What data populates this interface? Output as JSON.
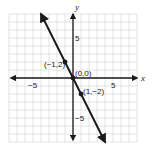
{
  "chart_data": {
    "type": "line",
    "title": "",
    "xlabel": "x",
    "ylabel": "y",
    "xlim": [
      -8,
      8
    ],
    "ylim": [
      -8,
      8
    ],
    "grid": true,
    "equation": "y = -2x",
    "x_tick_labels": [
      {
        "value": -5,
        "label": "−5"
      },
      {
        "value": 5,
        "label": "5"
      }
    ],
    "y_tick_labels": [
      {
        "value": 5,
        "label": "5"
      },
      {
        "value": -5,
        "label": "−5"
      }
    ],
    "series": [
      {
        "name": "y = -2x",
        "x": [
          -4,
          4
        ],
        "y": [
          8,
          -8
        ],
        "arrows": "both"
      }
    ],
    "points": [
      {
        "x": -1,
        "y": 2,
        "label": "(−1,2)"
      },
      {
        "x": 0,
        "y": 0,
        "label": "(0,0)"
      },
      {
        "x": 1,
        "y": -2,
        "label": "(1,−2)"
      }
    ]
  },
  "colors": {
    "grid": "#d9d9d9",
    "axis": "#1a1a1a",
    "line": "#1a1a1a",
    "background": "#ffffff"
  }
}
